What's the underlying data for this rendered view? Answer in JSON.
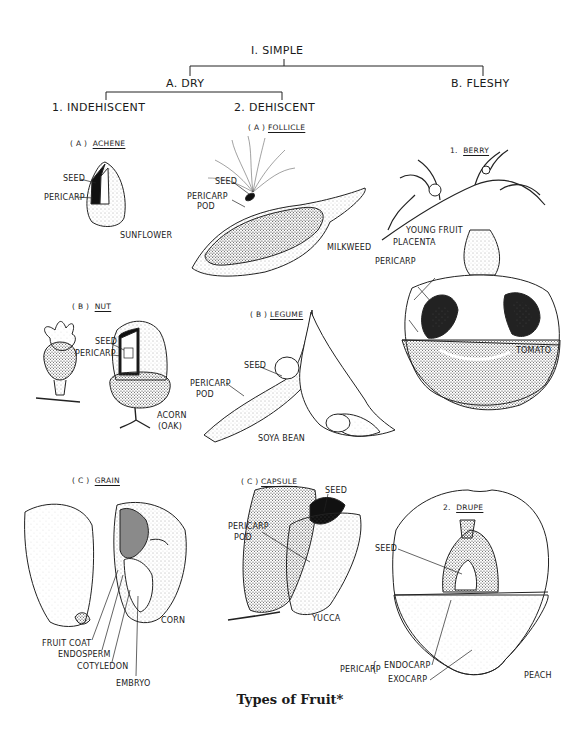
{
  "tree": {
    "root": "I.  SIMPLE",
    "dry": "A. DRY",
    "fleshy": "B. FLESHY",
    "indehiscent": "1.  INDEHISCENT",
    "dehiscent": "2.  DEHISCENT"
  },
  "sections": {
    "achene": {
      "prefix": "( A )",
      "name": "ACHENE",
      "example": "SUNFLOWER",
      "labels": [
        "SEED",
        "PERICARP"
      ]
    },
    "follicle": {
      "prefix": "( A )",
      "name": "FOLLICLE",
      "example": "MILKWEED",
      "labels": [
        "SEED",
        "PERICARP",
        "POD"
      ]
    },
    "berry": {
      "prefix": "1.",
      "name": "BERRY",
      "example": "TOMATO",
      "labels": [
        "YOUNG FRUIT",
        "PLACENTA",
        "PERICARP"
      ]
    },
    "nut": {
      "prefix": "( B )",
      "name": "NUT",
      "example": "ACORN",
      "example2": "(OAK)",
      "labels": [
        "SEED",
        "PERICARP"
      ]
    },
    "legume": {
      "prefix": "( B )",
      "name": "LEGUME",
      "example": "SOYA BEAN",
      "labels": [
        "SEED",
        "PERICARP",
        "POD"
      ]
    },
    "grain": {
      "prefix": "( C )",
      "name": "GRAIN",
      "example": "CORN",
      "labels": [
        "FRUIT COAT",
        "ENDOSPERM",
        "COTYLEDON",
        "EMBRYO"
      ]
    },
    "capsule": {
      "prefix": "( C )",
      "name": "CAPSULE",
      "example": "YUCCA",
      "labels": [
        "SEED",
        "PERICARP",
        "POD"
      ]
    },
    "drupe": {
      "prefix": "2.",
      "name": "DRUPE",
      "example": "PEACH",
      "labels": [
        "SEED",
        "PERICARP",
        "ENDOCARP",
        "EXOCARP"
      ]
    }
  },
  "caption": "Types of Fruit*"
}
